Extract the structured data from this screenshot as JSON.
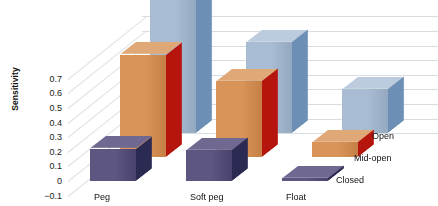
{
  "chart_data": {
    "type": "bar",
    "title": "",
    "xlabel": "",
    "ylabel": "Sensitivity",
    "zlabel": "",
    "categories": [
      "Peg",
      "Soft peg",
      "Float"
    ],
    "ylim": [
      -0.1,
      0.7
    ],
    "yticks": [
      "0.7",
      "0.6",
      "0.5",
      "0.4",
      "0.3",
      "0.2",
      "0.1",
      "0",
      "−0.1"
    ],
    "ytick_values": [
      0.7,
      0.6,
      0.5,
      0.4,
      0.3,
      0.2,
      0.1,
      0,
      -0.1
    ],
    "grid": true,
    "legend_position": "right-depth-axis",
    "threed": true,
    "series": [
      {
        "name": "Closed",
        "values": [
          0.22,
          0.21,
          0.02
        ],
        "color": "#5d5680",
        "side_color": "#2b2a52",
        "top_color": "#6f6992"
      },
      {
        "name": "Mid-open",
        "values": [
          0.7,
          0.52,
          0.1
        ],
        "color": "#d9945a",
        "side_color": "#b5150d",
        "top_color": "#e0a877"
      },
      {
        "name": "Open",
        "values": [
          0.97,
          0.62,
          0.3
        ],
        "color": "#a8bdd4",
        "side_color": "#6d8fb5",
        "top_color": "#bccbdd"
      }
    ]
  },
  "legend": {
    "items": [
      "Open",
      "Mid-open",
      "Closed"
    ]
  }
}
